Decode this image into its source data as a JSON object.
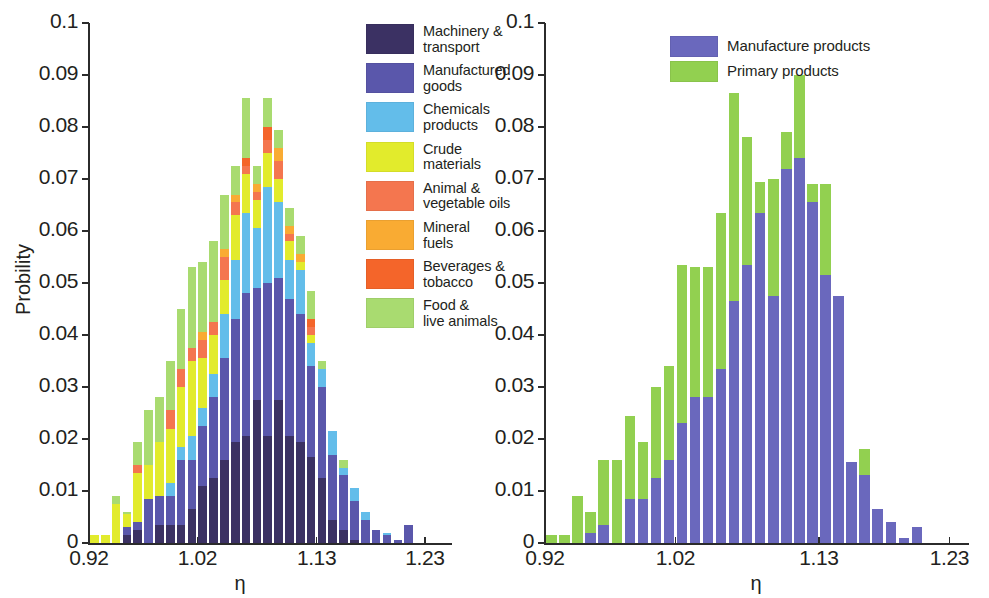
{
  "figure": {
    "background": "#ffffff"
  },
  "panels": [
    {
      "id": "left",
      "y_axis": {
        "label": "Probility",
        "ticks": [
          "0",
          "0.01",
          "0.02",
          "0.03",
          "0.04",
          "0.05",
          "0.06",
          "0.07",
          "0.08",
          "0.09",
          "0.1"
        ],
        "min": 0,
        "max": 0.1
      },
      "x_axis": {
        "label": "η",
        "ticks": [
          "0.92",
          "1.02",
          "1.13",
          "1.23"
        ],
        "tick_values": [
          0.92,
          1.02,
          1.13,
          1.23
        ],
        "min": 0.92,
        "max": 1.255
      },
      "legend": {
        "items": [
          {
            "label": "Machinery &\ntransport",
            "color": "#3b3163"
          },
          {
            "label": "Manufactured\ngoods",
            "color": "#5a57ab"
          },
          {
            "label": "Chemicals\nproducts",
            "color": "#63bdea"
          },
          {
            "label": "Crude\nmaterials",
            "color": "#e2eb2c"
          },
          {
            "label": "Animal &\nvegetable oils",
            "color": "#f4764f"
          },
          {
            "label": "Mineral\nfuels",
            "color": "#f9ab33"
          },
          {
            "label": "Beverages &\ntobacco",
            "color": "#f4652a"
          },
          {
            "label": "Food &\nlive animals",
            "color": "#a9db70"
          }
        ]
      }
    },
    {
      "id": "right",
      "y_axis": {
        "label": "",
        "ticks": [
          "0",
          "0.01",
          "0.02",
          "0.03",
          "0.04",
          "0.05",
          "0.06",
          "0.07",
          "0.08",
          "0.09",
          "0.1"
        ],
        "min": 0,
        "max": 0.1
      },
      "x_axis": {
        "label": "η",
        "ticks": [
          "0.92",
          "1.02",
          "1.13",
          "1.23"
        ],
        "tick_values": [
          0.92,
          1.02,
          1.13,
          1.23
        ],
        "min": 0.92,
        "max": 1.245
      },
      "legend": {
        "items": [
          {
            "label": "Manufacture products",
            "color": "#6a68bd"
          },
          {
            "label": "Primary products",
            "color": "#92d050"
          }
        ]
      }
    }
  ],
  "chart_data": [
    {
      "type": "bar",
      "stacked": true,
      "panel": "left",
      "title": "",
      "xlabel": "η",
      "ylabel": "Probility",
      "xlim": [
        0.92,
        1.255
      ],
      "ylim": [
        0.0,
        0.1
      ],
      "grid": false,
      "legend_position": "top-right (inside)",
      "categories": [
        0.925,
        0.935,
        0.945,
        0.955,
        0.965,
        0.975,
        0.985,
        0.995,
        1.005,
        1.015,
        1.025,
        1.035,
        1.045,
        1.055,
        1.065,
        1.075,
        1.085,
        1.095,
        1.105,
        1.115,
        1.125,
        1.135,
        1.145,
        1.155,
        1.165,
        1.175,
        1.185,
        1.195,
        1.205,
        1.215
      ],
      "series": [
        {
          "name": "Machinery & transport",
          "color": "#3b3163",
          "values": [
            0,
            0,
            0,
            0.0015,
            0.0025,
            0,
            0.0035,
            0.0035,
            0.0035,
            0.0065,
            0.011,
            0.0125,
            0.016,
            0.0195,
            0.0205,
            0.0275,
            0.0205,
            0.0275,
            0.0205,
            0.0195,
            0.0165,
            0.0125,
            0.0045,
            0.0025,
            0.0005,
            0,
            0,
            0,
            0,
            0
          ]
        },
        {
          "name": "Manufactured goods",
          "color": "#5a57ab",
          "values": [
            0,
            0,
            0,
            0.0015,
            0.0015,
            0.0085,
            0.0055,
            0.0055,
            0.0125,
            0.0095,
            0.0115,
            0.0155,
            0.0195,
            0.0235,
            0.0275,
            0.0215,
            0.0295,
            0.0235,
            0.0265,
            0.0245,
            0.0175,
            0.0175,
            0.0125,
            0.0105,
            0.0075,
            0.0045,
            0.0025,
            0.0015,
            0.0005,
            0.0035
          ]
        },
        {
          "name": "Chemicals products",
          "color": "#63bdea",
          "values": [
            0,
            0,
            0,
            0,
            0,
            0,
            0,
            0.0025,
            0.0025,
            0.0045,
            0.0035,
            0.0045,
            0.0085,
            0.0115,
            0.0155,
            0.0115,
            0.0185,
            0.0145,
            0.0075,
            0.0085,
            0.0045,
            0.0035,
            0.0045,
            0.0015,
            0.0025,
            0.0015,
            0,
            0.0005,
            0,
            0
          ]
        },
        {
          "name": "Crude materials",
          "color": "#e2eb2c",
          "values": [
            0.0015,
            0.0015,
            0.0075,
            0.0025,
            0.0095,
            0.0065,
            0.0105,
            0.0105,
            0.0115,
            0.0145,
            0.0095,
            0.0075,
            0.0065,
            0.0085,
            0.0075,
            0.0055,
            0.0065,
            0.0045,
            0.0035,
            0.0015,
            0.0015,
            0,
            0,
            0,
            0,
            0,
            0,
            0,
            0,
            0
          ]
        },
        {
          "name": "Animal & vegetable oils",
          "color": "#f4764f",
          "values": [
            0,
            0,
            0,
            0,
            0.0015,
            0,
            0,
            0.0035,
            0.0035,
            0.0025,
            0.0035,
            0.0025,
            0.0045,
            0.0025,
            0.0015,
            0.0015,
            0.0025,
            0.0035,
            0.0015,
            0,
            0.0015,
            0,
            0,
            0,
            0,
            0,
            0,
            0,
            0,
            0
          ]
        },
        {
          "name": "Mineral fuels",
          "color": "#f9ab33",
          "values": [
            0,
            0,
            0,
            0,
            0,
            0,
            0,
            0,
            0,
            0,
            0.0015,
            0,
            0.0015,
            0.0015,
            0,
            0.0015,
            0,
            0.0025,
            0.0015,
            0.0015,
            0,
            0,
            0,
            0,
            0,
            0,
            0,
            0,
            0,
            0
          ]
        },
        {
          "name": "Beverages & tobacco",
          "color": "#f4652a",
          "values": [
            0,
            0,
            0,
            0,
            0,
            0,
            0,
            0,
            0,
            0,
            0,
            0,
            0,
            0,
            0.0015,
            0,
            0.0025,
            0,
            0,
            0,
            0.0015,
            0,
            0,
            0,
            0,
            0,
            0,
            0,
            0,
            0
          ]
        },
        {
          "name": "Food & live animals",
          "color": "#a9db70",
          "values": [
            0,
            0,
            0.0015,
            0.0005,
            0.0045,
            0.0105,
            0.0085,
            0.0095,
            0.0115,
            0.0155,
            0.0135,
            0.0155,
            0.0105,
            0.0055,
            0.0115,
            0.0035,
            0.0055,
            0.0035,
            0.0035,
            0.0035,
            0.0055,
            0.0015,
            0,
            0.0015,
            0,
            0,
            0,
            0,
            0,
            0
          ]
        }
      ]
    },
    {
      "type": "bar",
      "stacked": true,
      "panel": "right",
      "title": "",
      "xlabel": "η",
      "ylabel": "",
      "xlim": [
        0.92,
        1.245
      ],
      "ylim": [
        0.0,
        0.1
      ],
      "grid": false,
      "legend_position": "top-right (inside)",
      "categories": [
        0.925,
        0.935,
        0.945,
        0.955,
        0.965,
        0.975,
        0.985,
        0.995,
        1.005,
        1.015,
        1.025,
        1.035,
        1.045,
        1.055,
        1.065,
        1.075,
        1.085,
        1.095,
        1.105,
        1.115,
        1.125,
        1.135,
        1.145,
        1.155,
        1.165,
        1.175,
        1.185,
        1.195,
        1.205,
        1.215,
        1.225
      ],
      "series": [
        {
          "name": "Manufacture products",
          "color": "#6a68bd",
          "values": [
            0,
            0,
            0,
            0.002,
            0.0035,
            0,
            0.0085,
            0.0085,
            0.0125,
            0.016,
            0.023,
            0.028,
            0.028,
            0.0335,
            0.0465,
            0.0535,
            0.0635,
            0.0475,
            0.072,
            0.074,
            0.0655,
            0.0515,
            0.0475,
            0.0155,
            0.013,
            0.0065,
            0.004,
            0.001,
            0.003,
            0,
            0
          ]
        },
        {
          "name": "Primary products",
          "color": "#92d050",
          "values": [
            0.0015,
            0.0015,
            0.009,
            0.004,
            0.0125,
            0.016,
            0.016,
            0.011,
            0.0175,
            0.018,
            0.0305,
            0.025,
            0.025,
            0.03,
            0.04,
            0.0245,
            0.006,
            0.0225,
            0.007,
            0.016,
            0.0035,
            0.0175,
            0,
            0,
            0.005,
            0,
            0,
            0,
            0,
            0,
            0
          ]
        }
      ]
    }
  ]
}
